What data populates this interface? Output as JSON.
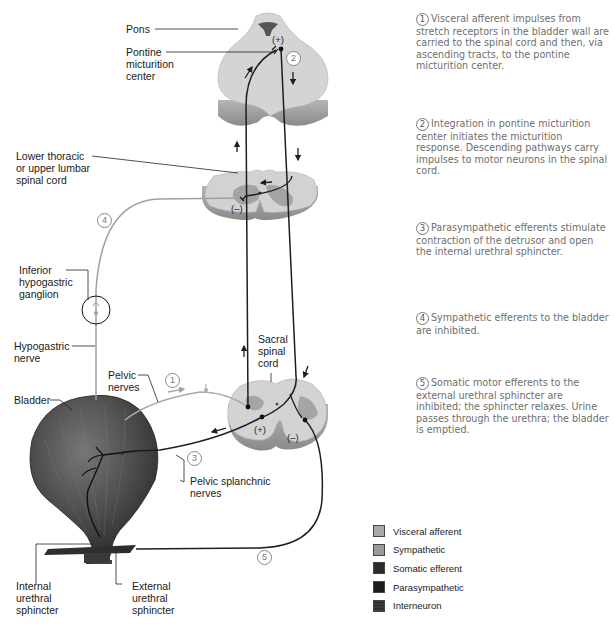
{
  "labels": {
    "pons": "Pons",
    "pontine_center": "Pontine\nmicturition\ncenter",
    "lower_thoracic": "Lower thoracic\nor upper lumbar\nspinal cord",
    "inferior_ganglion": "Inferior\nhypogastric\nganglion",
    "hypogastric_nerve": "Hypogastric\nnerve",
    "bladder": "Bladder",
    "pelvic_nerves": "Pelvic\nnerves",
    "sacral_cord": "Sacral\nspinal\ncord",
    "pelvic_splanchnic": "Pelvic splanchnic\nnerves",
    "internal_sphincter": "Internal\nurethral\nsphincter",
    "external_sphincter": "External\nurethral\nsphincter"
  },
  "signs": {
    "pons_plus": "(+)",
    "lumbar_minus": "(–)",
    "sacral_plus": "(+)",
    "sacral_minus": "(–)"
  },
  "markers": {
    "m1": "1",
    "m2": "2",
    "m3": "3",
    "m4": "4",
    "m5": "5"
  },
  "steps": [
    {
      "num": "1",
      "text": "Visceral afferent impulses from stretch receptors in the bladder wall are carried to the spinal cord and then, via ascending tracts, to the pontine micturition center."
    },
    {
      "num": "2",
      "text": "Integration in pontine micturition center initiates the micturition response. Descending pathways carry impulses to motor neurons in the spinal cord."
    },
    {
      "num": "3",
      "text": "Parasympathetic efferents stimulate contraction of the detrusor and open the internal urethral sphincter."
    },
    {
      "num": "4",
      "text": "Sympathetic efferents to the bladder are inhibited."
    },
    {
      "num": "5",
      "text": "Somatic motor efferents to the external urethral sphincter are inhibited; the sphincter relaxes. Urine passes through the urethra; the bladder is emptied."
    }
  ],
  "legend": [
    {
      "label": "Visceral afferent",
      "color": "#a9a9a9"
    },
    {
      "label": "Sympathetic",
      "color": "#9a9a9a"
    },
    {
      "label": "Somatic efferent",
      "color": "#2b2b2b"
    },
    {
      "label": "Parasympathetic",
      "color": "#1c1c1c"
    },
    {
      "label": "Interneuron",
      "color": "#3a3a3a"
    }
  ],
  "colors": {
    "visceral_afferent": "#a9a9a9",
    "sympathetic": "#a0a0a0",
    "efferent": "#1e1e1e",
    "tissue": "#d6d6d6",
    "tissue_side": "#9c9c9c",
    "gray_matter": "#a8a8a8",
    "bladder": "#4a4a4a",
    "step_text": "#6e6e6e"
  }
}
